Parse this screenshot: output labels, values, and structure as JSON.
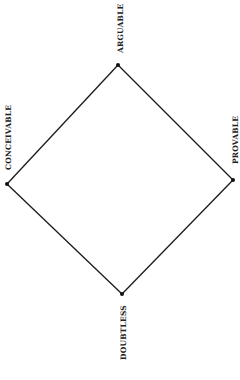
{
  "diagram": {
    "type": "square-of-opposition",
    "background": "#ffffff",
    "line_color": "#1a1a1a",
    "vertices": [
      {
        "id": "top",
        "label": "ARGUABLE",
        "x": 118,
        "y": 65
      },
      {
        "id": "right",
        "label": "PROVABLE",
        "x": 233,
        "y": 180
      },
      {
        "id": "bottom",
        "label": "DOUBTLESS",
        "x": 122,
        "y": 294
      },
      {
        "id": "left",
        "label": "CONCEIVABLE",
        "x": 7,
        "y": 184
      }
    ],
    "edges": [
      {
        "from": "top",
        "to": "right"
      },
      {
        "from": "right",
        "to": "bottom"
      },
      {
        "from": "bottom",
        "to": "left"
      },
      {
        "from": "left",
        "to": "top"
      }
    ],
    "labels": {
      "top": "ARGUABLE",
      "right": "PROVABLE",
      "bottom": "DOUBTLESS",
      "left": "CONCEIVABLE"
    }
  }
}
